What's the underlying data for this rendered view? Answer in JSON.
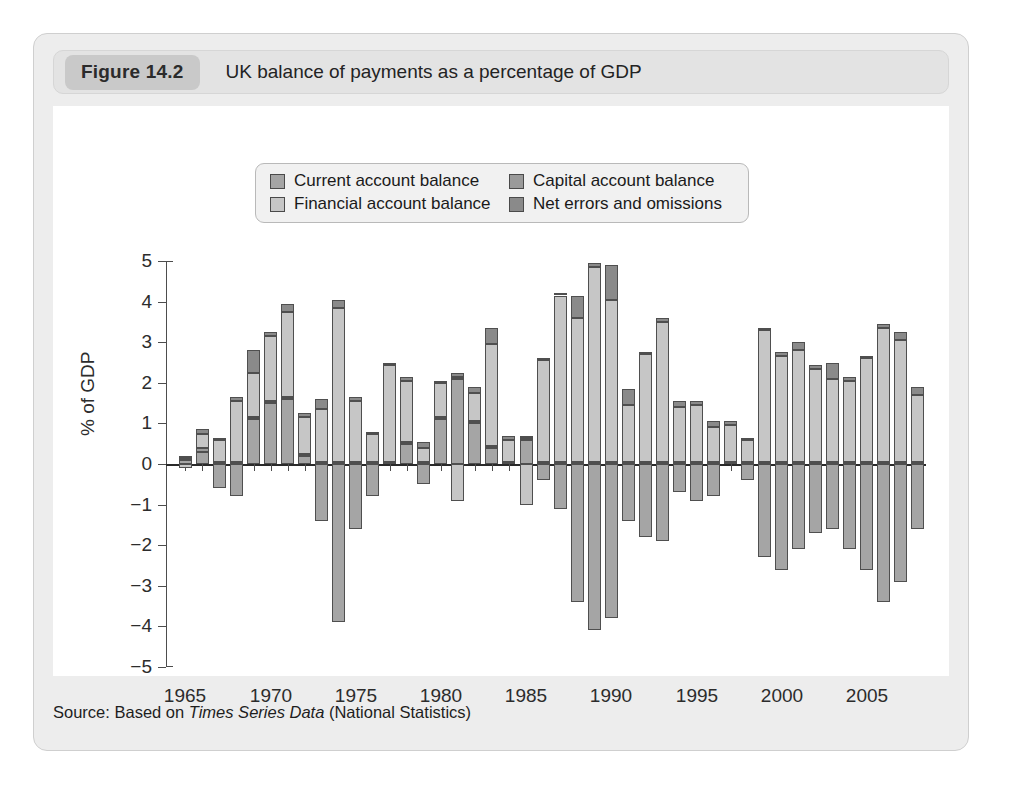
{
  "figure": {
    "number_label": "Figure 14.2",
    "title": "UK balance of payments as a percentage of GDP",
    "source": "Source: Based on ",
    "source_italic": "Times Series Data",
    "source_tail": " (National Statistics)"
  },
  "legend": {
    "items": [
      {
        "label": "Current account balance",
        "color": "#a5a5a5"
      },
      {
        "label": "Capital account balance",
        "color": "#9a9a9a"
      },
      {
        "label": "Financial account balance",
        "color": "#c6c6c6"
      },
      {
        "label": "Net errors and omissions",
        "color": "#8a8a8a"
      }
    ]
  },
  "colors": {
    "card_background": "#ededed",
    "header_background": "#e3e3e3",
    "pill_background": "#c9c9c9",
    "plot_background": "#ffffff",
    "axis": "#4d4d4d",
    "current": "#a5a5a5",
    "capital": "#9a9a9a",
    "financial": "#c6c6c6",
    "errors": "#8a8a8a"
  },
  "chart_data": {
    "type": "bar",
    "stacked": true,
    "title": "UK balance of payments as a percentage of GDP",
    "xlabel": "",
    "ylabel": "% of GDP",
    "ylim": [
      -5,
      5
    ],
    "ytick_values": [
      5,
      4,
      3,
      2,
      1,
      0,
      -1,
      -2,
      -3,
      -4,
      -5
    ],
    "ytick_labels": [
      "5",
      "4",
      "3",
      "2",
      "1",
      "0",
      "−1",
      "−2",
      "−3",
      "−4",
      "−5"
    ],
    "xtick_labels": [
      "1965",
      "1970",
      "1975",
      "1980",
      "1985",
      "1990",
      "1995",
      "2000",
      "2005"
    ],
    "xtick_years": [
      1965,
      1970,
      1975,
      1980,
      1985,
      1990,
      1995,
      2000,
      2005
    ],
    "grid": false,
    "legend_position": "top-center",
    "x": [
      1965,
      1966,
      1967,
      1968,
      1969,
      1970,
      1971,
      1972,
      1973,
      1974,
      1975,
      1976,
      1977,
      1978,
      1979,
      1980,
      1981,
      1982,
      1983,
      1984,
      1985,
      1986,
      1987,
      1988,
      1989,
      1990,
      1991,
      1992,
      1993,
      1994,
      1995,
      1996,
      1997,
      1998,
      1999,
      2000,
      2001,
      2002,
      2003,
      2004,
      2005,
      2006,
      2007,
      2008
    ],
    "series": [
      {
        "name": "Current account balance",
        "key": "current",
        "values": [
          0.1,
          0.3,
          -0.6,
          -0.8,
          1.1,
          1.5,
          1.6,
          0.2,
          -1.4,
          -3.9,
          -1.6,
          -0.8,
          0.0,
          0.5,
          -0.5,
          1.1,
          2.1,
          1.0,
          0.4,
          0.0,
          0.6,
          -0.4,
          -1.1,
          -3.4,
          -4.1,
          -3.8,
          -1.4,
          -1.8,
          -1.9,
          -0.7,
          -0.9,
          -0.8,
          0.0,
          -0.4,
          -2.3,
          -2.6,
          -2.1,
          -1.7,
          -1.6,
          -2.1,
          -2.6,
          -3.4,
          -2.9,
          -1.6
        ]
      },
      {
        "name": "Capital account balance",
        "key": "capital",
        "values": [
          0.05,
          0.1,
          0.05,
          0.05,
          0.05,
          0.05,
          0.05,
          0.05,
          0.05,
          0.05,
          0.05,
          0.05,
          0.05,
          0.05,
          0.05,
          0.05,
          0.05,
          0.05,
          0.05,
          0.05,
          0.05,
          0.05,
          0.05,
          0.05,
          0.05,
          0.05,
          0.05,
          0.05,
          0.05,
          0.05,
          0.05,
          0.05,
          0.05,
          0.05,
          0.05,
          0.05,
          0.05,
          0.05,
          0.05,
          0.05,
          0.05,
          0.05,
          0.05,
          0.05
        ]
      },
      {
        "name": "Financial account balance",
        "key": "financial",
        "values": [
          -0.1,
          0.35,
          0.55,
          1.5,
          1.1,
          1.6,
          2.1,
          0.9,
          1.3,
          3.8,
          1.5,
          0.7,
          2.4,
          1.5,
          0.35,
          0.85,
          -0.9,
          0.7,
          2.5,
          0.55,
          -1.0,
          2.5,
          4.1,
          3.55,
          4.8,
          4.0,
          1.4,
          2.65,
          3.45,
          1.35,
          1.4,
          0.85,
          0.9,
          0.55,
          3.25,
          2.6,
          2.75,
          2.3,
          2.05,
          2.0,
          2.55,
          3.3,
          3.0,
          1.65
        ]
      },
      {
        "name": "Net errors and omissions",
        "key": "errors",
        "values": [
          0.05,
          0.1,
          0.05,
          0.1,
          0.55,
          0.1,
          0.2,
          0.1,
          0.25,
          0.2,
          0.1,
          0.05,
          0.05,
          0.1,
          0.15,
          0.05,
          0.1,
          0.15,
          0.4,
          0.1,
          0.05,
          0.05,
          0.05,
          0.55,
          0.1,
          0.85,
          0.4,
          0.05,
          0.1,
          0.15,
          0.1,
          0.15,
          0.1,
          0.05,
          0.05,
          0.1,
          0.2,
          0.1,
          0.4,
          0.1,
          0.05,
          0.1,
          0.2,
          0.2
        ]
      }
    ]
  }
}
